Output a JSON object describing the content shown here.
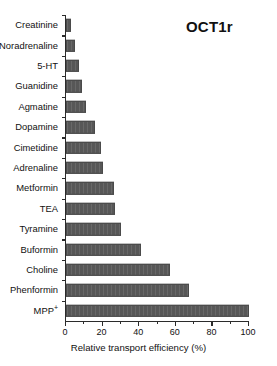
{
  "chart_data": {
    "type": "bar",
    "orientation": "horizontal",
    "title": "OCT1r",
    "xlabel": "Relative transport efficiency (%)",
    "ylabel": "",
    "xlim": [
      0,
      100
    ],
    "xticks": [
      0,
      20,
      40,
      60,
      80,
      100
    ],
    "xticklabels": [
      "0",
      "20",
      "40",
      "60",
      "80",
      "100"
    ],
    "grid": false,
    "legend": null,
    "bar_color": "#575757",
    "categories": [
      "Creatinine",
      "Noradrenaline",
      "5-HT",
      "Guanidine",
      "Agmatine",
      "Dopamine",
      "Cimetidine",
      "Adrenaline",
      "Metformin",
      "TEA",
      "Tyramine",
      "Buformin",
      "Choline",
      "Phenformin",
      "MPP+"
    ],
    "category_labels_html": [
      "Creatinine",
      "Noradrenaline",
      "5-HT",
      "Guanidine",
      "Agmatine",
      "Dopamine",
      "Cimetidine",
      "Adrenaline",
      "Metformin",
      "TEA",
      "Tyramine",
      "Buformin",
      "Choline",
      "Phenformin",
      "MPP<sup>+</sup>"
    ],
    "values": [
      3,
      5,
      7,
      9,
      11,
      16,
      19,
      20,
      26,
      27,
      30,
      41,
      57,
      67,
      100
    ]
  }
}
